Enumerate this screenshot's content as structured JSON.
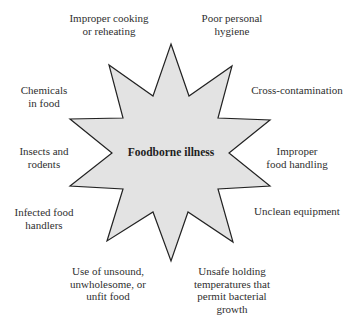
{
  "diagram": {
    "type": "radial-star-cause-diagram",
    "center": {
      "label": "Foodborne illness",
      "x": 171,
      "y": 156
    },
    "star": {
      "fill": "#e3e3e3",
      "stroke": "#222222",
      "points": [
        [
          171,
          44
        ],
        [
          189,
          96
        ],
        [
          232,
          66
        ],
        [
          218,
          118
        ],
        [
          270,
          120
        ],
        [
          229,
          153
        ],
        [
          270,
          186
        ],
        [
          218,
          189
        ],
        [
          233,
          242
        ],
        [
          188,
          212
        ],
        [
          171,
          261
        ],
        [
          153,
          212
        ],
        [
          107,
          241
        ],
        [
          123,
          189
        ],
        [
          70,
          186
        ],
        [
          112,
          153
        ],
        [
          70,
          119
        ],
        [
          123,
          118
        ],
        [
          109,
          65
        ],
        [
          153,
          96
        ]
      ]
    },
    "causes": [
      {
        "id": "improper-cooking",
        "x": 109,
        "y": 22,
        "lines": [
          "Improper cooking",
          "or reheating"
        ]
      },
      {
        "id": "poor-hygiene",
        "x": 232,
        "y": 22,
        "lines": [
          "Poor personal",
          "hygiene"
        ]
      },
      {
        "id": "cross-contamination",
        "x": 297,
        "y": 94,
        "lines": [
          "Cross-contamination"
        ]
      },
      {
        "id": "improper-handling",
        "x": 297,
        "y": 155,
        "lines": [
          "Improper",
          "food handling"
        ]
      },
      {
        "id": "unclean-equipment",
        "x": 297,
        "y": 215,
        "lines": [
          "Unclean equipment"
        ]
      },
      {
        "id": "unsafe-temperatures",
        "x": 232,
        "y": 275,
        "lines": [
          "Unsafe holding",
          "temperatures that",
          "permit bacterial",
          "growth"
        ]
      },
      {
        "id": "unsound-food",
        "x": 108,
        "y": 275,
        "lines": [
          "Use of unsound,",
          "unwholesome, or",
          "unfit food"
        ]
      },
      {
        "id": "infected-handlers",
        "x": 44,
        "y": 216,
        "lines": [
          "Infected food",
          "handlers"
        ]
      },
      {
        "id": "insects-rodents",
        "x": 44,
        "y": 155,
        "lines": [
          "Insects and",
          "rodents"
        ]
      },
      {
        "id": "chemicals",
        "x": 44,
        "y": 94,
        "lines": [
          "Chemicals",
          "in food"
        ]
      }
    ],
    "line_height": 12.6
  }
}
